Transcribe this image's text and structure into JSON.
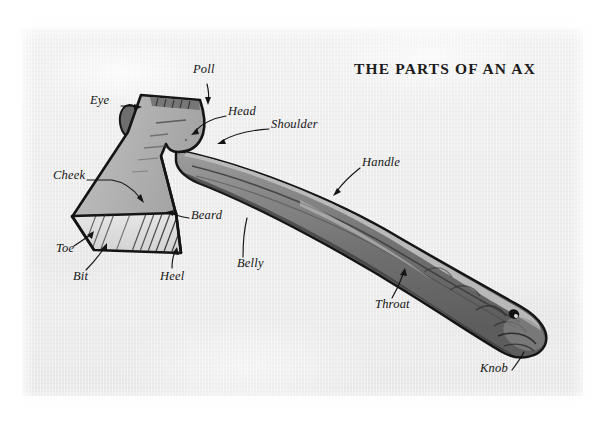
{
  "document": {
    "title": "THE PARTS OF AN AX",
    "medium": "printed diagram on textured paper",
    "subject": "ax",
    "paper_color": "#efefef",
    "ink_color": "#141414"
  },
  "palette": {
    "paper": "#efefef",
    "paper_edge": "#ffffff",
    "ink": "#141414",
    "head_light": "#b9b9b9",
    "head_mid": "#a8a8a8",
    "bit_light": "#e2e2e2",
    "eye_dark": "#6f6f6f",
    "handle_dark": "#6a6a6a",
    "handle_mid": "#7d7d7d",
    "handle_light": "#b4b4b4",
    "handle_shadow": "#4a4a4a"
  },
  "diagram": {
    "type": "labeled-illustration",
    "label_count": 12,
    "labels": [
      {
        "id": "poll",
        "text": "Poll",
        "x": 193,
        "y": 69,
        "anchor_x": 208,
        "anchor_y": 104,
        "leader": "vertical-short"
      },
      {
        "id": "eye",
        "text": "Eye",
        "x": 90,
        "y": 100,
        "anchor_x": 135,
        "anchor_y": 115,
        "leader": "horizontal"
      },
      {
        "id": "head",
        "text": "Head",
        "x": 228,
        "y": 111,
        "anchor_x": 194,
        "anchor_y": 134,
        "leader": "curve-left-down"
      },
      {
        "id": "shoulder",
        "text": "Shoulder",
        "x": 271,
        "y": 124,
        "anchor_x": 219,
        "anchor_y": 143,
        "leader": "curve-left-down"
      },
      {
        "id": "handle",
        "text": "Handle",
        "x": 362,
        "y": 162,
        "anchor_x": 335,
        "anchor_y": 195,
        "leader": "curve-left-down"
      },
      {
        "id": "cheek",
        "text": "Cheek",
        "x": 53,
        "y": 175,
        "anchor_x": 142,
        "anchor_y": 204,
        "leader": "horizontal-then-arrow"
      },
      {
        "id": "beard",
        "text": "Beard",
        "x": 191,
        "y": 215,
        "anchor_x": 169,
        "anchor_y": 212,
        "leader": "horizontal"
      },
      {
        "id": "toe",
        "text": "Toe",
        "x": 56,
        "y": 248,
        "anchor_x": 92,
        "anchor_y": 233,
        "leader": "diagonal-up-right"
      },
      {
        "id": "bit",
        "text": "Bit",
        "x": 73,
        "y": 276,
        "anchor_x": 104,
        "anchor_y": 248,
        "leader": "diagonal-up-right"
      },
      {
        "id": "heel",
        "text": "Heel",
        "x": 160,
        "y": 276,
        "anchor_x": 175,
        "anchor_y": 252,
        "leader": "diagonal-up-left"
      },
      {
        "id": "belly",
        "text": "Belly",
        "x": 237,
        "y": 263,
        "anchor_x": 247,
        "anchor_y": 218,
        "leader": "curve-up"
      },
      {
        "id": "throat",
        "text": "Throat",
        "x": 375,
        "y": 304,
        "anchor_x": 403,
        "anchor_y": 272,
        "leader": "curve-up-right"
      },
      {
        "id": "knob",
        "text": "Knob",
        "x": 480,
        "y": 368,
        "anchor_x": 522,
        "anchor_y": 348,
        "leader": "diagonal-up-right"
      }
    ]
  }
}
